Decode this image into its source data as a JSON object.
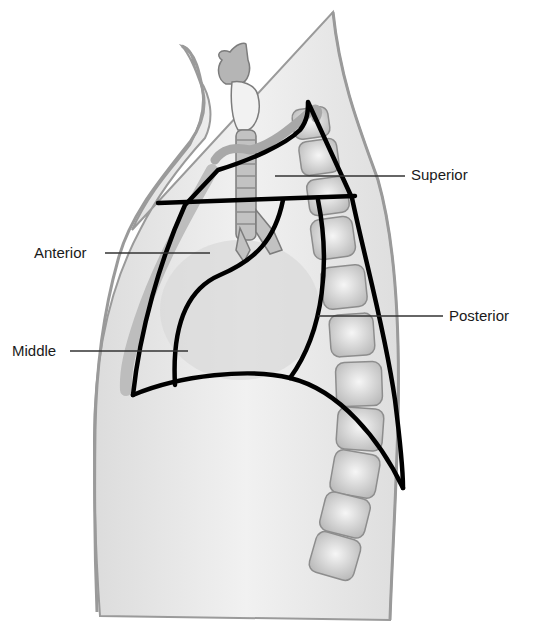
{
  "figure": {
    "labels": [
      {
        "id": "superior",
        "text": "Superior"
      },
      {
        "id": "anterior",
        "text": "Anterior"
      },
      {
        "id": "middle",
        "text": "Middle"
      },
      {
        "id": "posterior",
        "text": "Posterior"
      }
    ]
  },
  "colors": {
    "outline": "#000000",
    "leader": "#333333",
    "body_fill": "#e9e9e9",
    "body_edge": "#9a9a9a",
    "vertebra": "#d2d2d2",
    "trachea": "#b5b5b5"
  }
}
